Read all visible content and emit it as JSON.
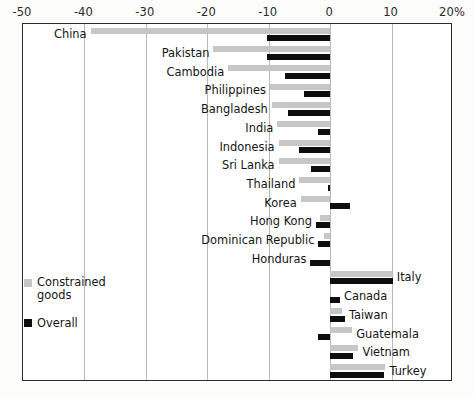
{
  "chart_data": {
    "type": "bar",
    "orientation": "horizontal",
    "title": "",
    "subtitle": "",
    "xlabel": "",
    "ylabel": "",
    "xlim": [
      -50,
      20
    ],
    "ylim": null,
    "grid": true,
    "grid_axis": "x",
    "legend_position": "bottom-left",
    "axis_unit": "percent",
    "xticks": [
      -50,
      -40,
      -30,
      -20,
      -10,
      0,
      10,
      20
    ],
    "xtick_labels": [
      "-50",
      "-40",
      "-30",
      "-20",
      "-10",
      "0",
      "10",
      "20%"
    ],
    "series": [
      {
        "name": "Constrained goods",
        "color": "#c6c6c6",
        "values": [
          -39.0,
          -19.0,
          -16.6,
          -9.8,
          -9.5,
          -8.6,
          -8.4,
          -8.4,
          -5.0,
          -4.8,
          -1.6,
          -1.0,
          0.0,
          10.0,
          0.0,
          2.0,
          3.6,
          4.6,
          9.0,
          7.6
        ]
      },
      {
        "name": "Overall",
        "color": "#0d0d0d",
        "values": [
          -10.2,
          -10.2,
          -7.3,
          -4.2,
          -6.8,
          -2.0,
          -5.0,
          -3.1,
          -0.4,
          3.2,
          -2.3,
          -1.9,
          -3.2,
          10.2,
          1.6,
          2.4,
          -2.0,
          3.7,
          8.8,
          3.7
        ]
      }
    ],
    "categories": [
      "China",
      "Pakistan",
      "Cambodia",
      "Philippines",
      "Bangladesh",
      "India",
      "Indonesia",
      "Sri Lanka",
      "Thailand",
      "Korea",
      "Hong Kong",
      "Dominican Republic",
      "Honduras",
      "Italy",
      "Canada",
      "Taiwan",
      "Guatemala",
      "Vietnam",
      "Turkey",
      "Mexico"
    ],
    "label_side": [
      "left",
      "left",
      "left",
      "left",
      "left",
      "left",
      "left",
      "left",
      "left",
      "left",
      "left",
      "left",
      "left",
      "right",
      "right",
      "right",
      "right",
      "right",
      "right",
      "right"
    ]
  },
  "legend": {
    "items": [
      {
        "label": "Constrained\ngoods",
        "color": "#c6c6c6",
        "key": "constrained"
      },
      {
        "label": "Overall",
        "color": "#0d0d0d",
        "key": "overall"
      }
    ]
  },
  "colors": {
    "constrained": "#c6c6c6",
    "overall": "#0d0d0d",
    "gridline": "#b9b9b9",
    "frame": "#2c2c2c",
    "background": "#ffffff"
  }
}
